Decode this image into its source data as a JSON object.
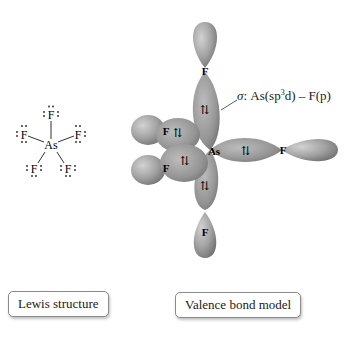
{
  "lewis_structure": {
    "central_atom": "As",
    "ligands": [
      "F",
      "F",
      "F",
      "F",
      "F"
    ],
    "label": "Lewis structure"
  },
  "valence_bond_model": {
    "central_atom": "As",
    "ligands": [
      "F",
      "F",
      "F",
      "F",
      "F"
    ],
    "electron_pair_symbol": "⇅",
    "annotation": {
      "sigma": "σ",
      "colon": ":",
      "as_part": "As(sp",
      "sup": "3",
      "d_part": "d) – F(p)"
    },
    "label": "Valence bond model"
  },
  "colors": {
    "orbital": "#9a9a9a",
    "orbital_light": "#c8c8c8",
    "orbital_dark": "#6e6e6e",
    "text": "#1a1a1a"
  }
}
